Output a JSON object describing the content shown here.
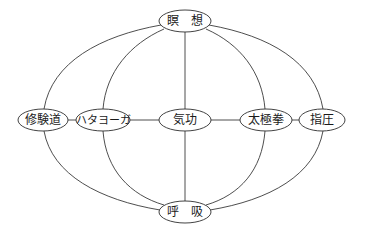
{
  "diagram": {
    "type": "network",
    "colors": {
      "line": "#3a3a3a",
      "node_border": "#2e2e2e",
      "text": "#1a1a1a",
      "background": "#ffffff"
    },
    "nodes": {
      "meditation": {
        "label": "瞑　想",
        "cx": 185,
        "cy": 21,
        "rx": 26,
        "ry": 11
      },
      "shugendo": {
        "label": "修験道",
        "cx": 43,
        "cy": 120,
        "rx": 25,
        "ry": 11
      },
      "hatha_yoga": {
        "label": "ハタヨーガ",
        "cx": 103,
        "cy": 120,
        "rx": 27,
        "ry": 11
      },
      "qigong": {
        "label": "気功",
        "cx": 185,
        "cy": 120,
        "rx": 26,
        "ry": 11
      },
      "tai_chi": {
        "label": "太極拳",
        "cx": 266,
        "cy": 120,
        "rx": 26,
        "ry": 11
      },
      "shiatsu": {
        "label": "指圧",
        "cx": 322,
        "cy": 120,
        "rx": 23,
        "ry": 11
      },
      "breathing": {
        "label": "呼　吸",
        "cx": 185,
        "cy": 212,
        "rx": 26,
        "ry": 11
      }
    },
    "edges": [
      {
        "from": "meditation",
        "to": "shugendo",
        "shape": "curve"
      },
      {
        "from": "meditation",
        "to": "hatha_yoga",
        "shape": "curve"
      },
      {
        "from": "meditation",
        "to": "qigong",
        "shape": "straight"
      },
      {
        "from": "meditation",
        "to": "tai_chi",
        "shape": "curve"
      },
      {
        "from": "meditation",
        "to": "shiatsu",
        "shape": "curve"
      },
      {
        "from": "breathing",
        "to": "shugendo",
        "shape": "curve"
      },
      {
        "from": "breathing",
        "to": "hatha_yoga",
        "shape": "curve"
      },
      {
        "from": "breathing",
        "to": "qigong",
        "shape": "straight"
      },
      {
        "from": "breathing",
        "to": "tai_chi",
        "shape": "curve"
      },
      {
        "from": "breathing",
        "to": "shiatsu",
        "shape": "curve"
      },
      {
        "from": "shugendo",
        "to": "hatha_yoga",
        "shape": "straight"
      },
      {
        "from": "hatha_yoga",
        "to": "qigong",
        "shape": "straight"
      },
      {
        "from": "qigong",
        "to": "tai_chi",
        "shape": "straight"
      },
      {
        "from": "tai_chi",
        "to": "shiatsu",
        "shape": "straight"
      }
    ]
  }
}
